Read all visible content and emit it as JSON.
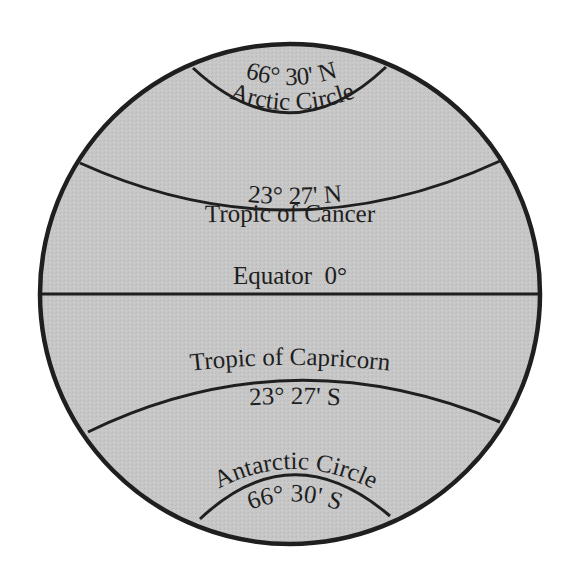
{
  "diagram": {
    "colors": {
      "globe_fill": "#c6c6c6",
      "line": "#1f1f1f",
      "background": "#ffffff"
    },
    "lines": [
      {
        "id": "arctic-circle",
        "name": "Arctic Circle",
        "latitude": "66° 30' N"
      },
      {
        "id": "tropic-of-cancer",
        "name": "Tropic of Cancer",
        "latitude": "23° 27' N"
      },
      {
        "id": "equator",
        "name": "Equator",
        "latitude": "0°",
        "label": "Equator  0°"
      },
      {
        "id": "tropic-of-capricorn",
        "name": "Tropic of Capricorn",
        "latitude": "23° 27' S"
      },
      {
        "id": "antarctic-circle",
        "name": "Antarctic Circle",
        "latitude": "66° 30' S"
      }
    ]
  }
}
